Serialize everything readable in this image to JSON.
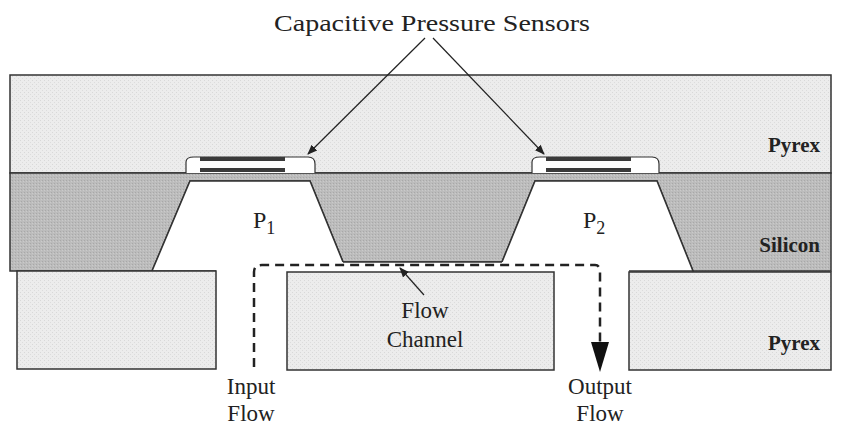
{
  "title": "Capacitive Pressure Sensors",
  "layers": {
    "top_pyrex": "Pyrex",
    "silicon": "Silicon",
    "bottom_pyrex": "Pyrex"
  },
  "cavities": {
    "p1": {
      "symbol": "P",
      "subscript": "1"
    },
    "p2": {
      "symbol": "P",
      "subscript": "2"
    }
  },
  "flow_channel": {
    "line1": "Flow",
    "line2": "Channel"
  },
  "input_flow": {
    "line1": "Input",
    "line2": "Flow"
  },
  "output_flow": {
    "line1": "Output",
    "line2": "Flow"
  },
  "colors": {
    "pyrex": "#ececec",
    "silicon": "#b9b9b9",
    "outline": "#333333",
    "electrode": "#3a3a3a",
    "background": "#ffffff"
  }
}
